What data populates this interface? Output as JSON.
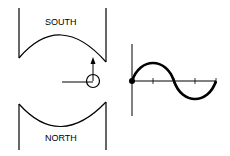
{
  "diagram": {
    "labels": {
      "top_pole": "SOUTH",
      "bottom_pole": "NORTH"
    },
    "elements": [
      {
        "name": "south-pole-piece",
        "shape": "U-shape with concave arc face"
      },
      {
        "name": "north-pole-piece",
        "shape": "inverted U-shape with concave arc face"
      },
      {
        "name": "conductor-loop",
        "shape": "circle with radial line and upward arrow"
      },
      {
        "name": "sine-wave-graph",
        "shape": "one full cycle starting at origin with dot"
      }
    ],
    "graph": {
      "type": "sine",
      "cycles": 1,
      "start_marker": "dot at origin",
      "x_ticks": 4
    },
    "colors": {
      "stroke": "#000000",
      "background": "#ffffff"
    }
  }
}
